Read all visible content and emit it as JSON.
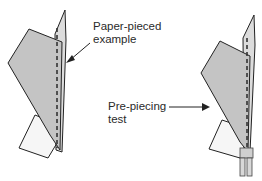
{
  "labels": {
    "example_line1": "Paper-pieced",
    "example_line2": "example",
    "test_line1": "Pre-piecing",
    "test_line2": "test"
  },
  "colors": {
    "fabric_fill": "#c4c4c4",
    "backing_fill": "#f4f4f4",
    "outline": "#222222"
  }
}
